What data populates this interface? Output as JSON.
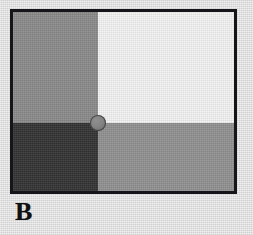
{
  "figure": {
    "panel_label": "B",
    "type": "lightness-contrast-stimulus",
    "frame": {
      "border_color": "#16161a",
      "border_width_px": 3
    },
    "background_color": "#dedede",
    "quadrants": [
      {
        "id": "top-left",
        "name": "top-left-quadrant",
        "color": "#8a8a8a",
        "tone": "medium gray"
      },
      {
        "id": "top-right",
        "name": "top-right-quadrant",
        "color": "#f2f2f2",
        "tone": "near white"
      },
      {
        "id": "bottom-left",
        "name": "bottom-left-quadrant",
        "color": "#333333",
        "tone": "dark gray"
      },
      {
        "id": "bottom-right",
        "name": "bottom-right-quadrant",
        "color": "#919191",
        "tone": "medium gray"
      }
    ],
    "center_disc": {
      "name": "center-disc",
      "color": "#848484",
      "outline_color": "#5c5c5c",
      "diameter_px": 16
    }
  },
  "chart_data": {
    "type": "heatmap",
    "title": "B",
    "xlabel": "",
    "ylabel": "",
    "categories": [
      "left",
      "right"
    ],
    "rows": [
      "top",
      "bottom"
    ],
    "values": [
      [
        138,
        242
      ],
      [
        51,
        145
      ]
    ],
    "series": [
      {
        "name": "top",
        "values": [
          138,
          242
        ]
      },
      {
        "name": "bottom",
        "values": [
          51,
          145
        ]
      }
    ],
    "annotations": [
      {
        "label": "center disc",
        "value": 132,
        "x": "quadrant-intersection",
        "y": "quadrant-intersection"
      }
    ],
    "grid": false,
    "legend": "none"
  }
}
